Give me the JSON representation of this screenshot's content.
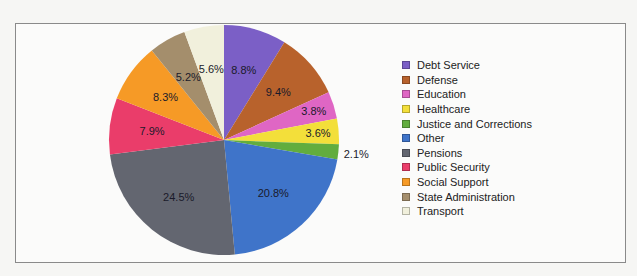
{
  "chart_data": {
    "type": "pie",
    "title": "",
    "start_angle": "12 o'clock",
    "direction": "clockwise",
    "legend_position": "right",
    "series": [
      {
        "name": "Debt Service",
        "value": 8.8,
        "label": "8.8%",
        "color": "#7b5fc6"
      },
      {
        "name": "Defense",
        "value": 9.4,
        "label": "9.4%",
        "color": "#b8622c"
      },
      {
        "name": "Education",
        "value": 3.8,
        "label": "3.8%",
        "color": "#df66c4"
      },
      {
        "name": "Healthcare",
        "value": 3.6,
        "label": "3.6%",
        "color": "#f3df3a"
      },
      {
        "name": "Justice and Corrections",
        "value": 2.1,
        "label": "2.1%",
        "color": "#62ad3e"
      },
      {
        "name": "Other",
        "value": 20.8,
        "label": "20.8%",
        "color": "#3f74c9"
      },
      {
        "name": "Pensions",
        "value": 24.5,
        "label": "24.5%",
        "color": "#636670"
      },
      {
        "name": "Public Security",
        "value": 7.9,
        "label": "7.9%",
        "color": "#ea3d6a"
      },
      {
        "name": "Social Support",
        "value": 8.3,
        "label": "8.3%",
        "color": "#f69a26"
      },
      {
        "name": "State Administration",
        "value": 5.2,
        "label": "5.2%",
        "color": "#a48e6c"
      },
      {
        "name": "Transport",
        "value": 5.6,
        "label": "5.6%",
        "color": "#f1f0dc"
      }
    ]
  }
}
